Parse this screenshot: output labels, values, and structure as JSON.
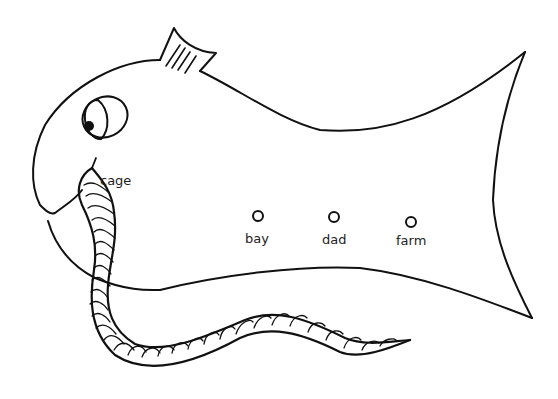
{
  "illustration": {
    "subject": "fish eating worm worksheet",
    "colors": {
      "line": "#111111",
      "background": "#ffffff",
      "text": "#222222"
    }
  },
  "labels": {
    "mouth_word": "cage",
    "choices": [
      {
        "word": "bay"
      },
      {
        "word": "dad"
      },
      {
        "word": "farm"
      }
    ]
  }
}
